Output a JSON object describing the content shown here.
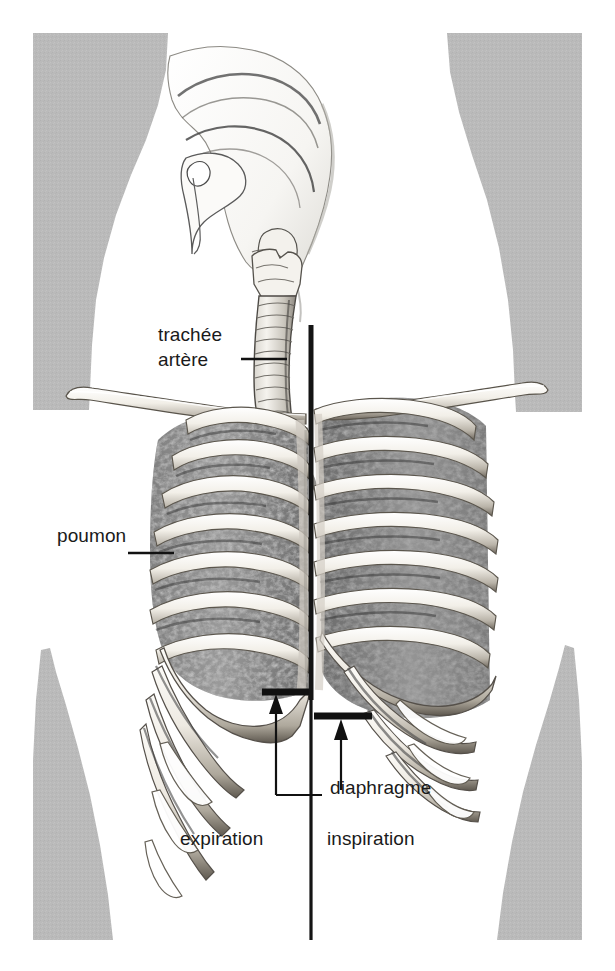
{
  "figure": {
    "kind": "anatomical-illustration",
    "language": "fr",
    "background_color": "#ffffff",
    "body_silhouette_color": "#b9b9b9",
    "ink_color": "#1a1a1a",
    "lung_tissue_color": "#8a8a8a",
    "bone_color": "#efece6"
  },
  "labels": {
    "trachee_artere": {
      "line1": "trachée",
      "line2": "artère",
      "x": 158,
      "y": 332,
      "leader": {
        "x1": 241,
        "y1": 359,
        "x2": 285,
        "y2": 359
      }
    },
    "poumon": {
      "text": "poumon",
      "x": 57,
      "y": 525,
      "leader": {
        "x1": 128,
        "y1": 553,
        "x2": 172,
        "y2": 553
      }
    },
    "diaphragme": {
      "text": "diaphragme",
      "x": 330,
      "y": 777
    },
    "expiration": {
      "text": "expiration",
      "x": 180,
      "y": 828
    },
    "inspiration": {
      "text": "inspiration",
      "x": 327,
      "y": 828
    }
  },
  "annotations": {
    "midline": {
      "name": "median-divider-line",
      "x": 311,
      "y_top": 325,
      "y_bottom": 940
    },
    "diaphragm_expiration_level": {
      "x1": 262,
      "x2": 310,
      "y": 692
    },
    "diaphragm_inspiration_level": {
      "x1": 314,
      "x2": 372,
      "y": 716
    },
    "excursion_arrow": {
      "x": 276,
      "y_tip": 698,
      "y_tail": 795
    },
    "excursion_bracket": {
      "x_left": 276,
      "y_bottom": 795,
      "x_right": 322
    },
    "inspiration_arrow": {
      "x": 341,
      "y_tip": 722,
      "y_tail": 790
    }
  },
  "anatomy_parts": [
    "cavité nasale",
    "langue",
    "épiglotte",
    "larynx",
    "trachée artère",
    "clavicule gauche",
    "clavicule droite",
    "côtes",
    "sternum",
    "poumon gauche",
    "poumon droit",
    "diaphragme"
  ]
}
